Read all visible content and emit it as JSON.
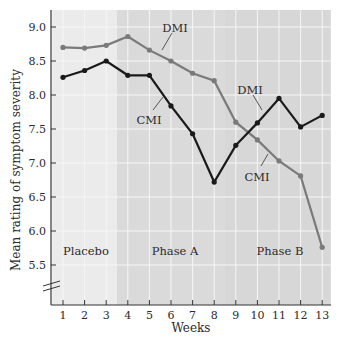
{
  "chart_data": {
    "type": "line",
    "title": "",
    "xlabel": "Weeks",
    "ylabel": "Mean rating of symptom severity",
    "xlim": [
      1,
      13
    ],
    "ylim": [
      5.5,
      9.0
    ],
    "x": [
      1,
      2,
      3,
      4,
      5,
      6,
      7,
      8,
      9,
      10,
      11,
      12,
      13
    ],
    "x_ticks": [
      "1",
      "2",
      "3",
      "4",
      "5",
      "6",
      "7",
      "8",
      "9",
      "10",
      "11",
      "12",
      "13"
    ],
    "y_ticks": [
      "9.0",
      "8.5",
      "8.0",
      "7.5",
      "7.0",
      "6.5",
      "6.0",
      "5.5"
    ],
    "y_tick_values": [
      9.0,
      8.5,
      8.0,
      7.5,
      7.0,
      6.5,
      6.0,
      5.5
    ],
    "grid": true,
    "axis_break": true,
    "series": [
      {
        "name": "Gray line (DMI in Phase A, CMI in Phase B)",
        "color": "#7a7a7a",
        "values": [
          8.7,
          8.69,
          8.73,
          8.86,
          8.66,
          8.5,
          8.32,
          8.21,
          7.6,
          7.34,
          7.03,
          6.81,
          5.76
        ]
      },
      {
        "name": "Black line (CMI in Phase A, DMI in Phase B)",
        "color": "#1a1a1a",
        "values": [
          8.26,
          8.36,
          8.5,
          8.29,
          8.29,
          7.84,
          7.43,
          6.72,
          7.26,
          7.59,
          7.95,
          7.53,
          7.7
        ]
      }
    ],
    "phases": [
      {
        "label": "Placebo",
        "from_week": 0.5,
        "to_week": 3.5,
        "color": "#ebebeb"
      },
      {
        "label": "Phase A",
        "from_week": 3.5,
        "to_week": 8.5,
        "color": "#dadada"
      },
      {
        "label": "Phase B",
        "from_week": 8.5,
        "to_week": 13.4,
        "color": "#d7d7d7"
      }
    ],
    "annotations": [
      {
        "text": "DMI",
        "x": 175,
        "y": 28,
        "line": [
          172,
          33,
          162,
          50
        ],
        "series": 0
      },
      {
        "text": "CMI",
        "x": 149,
        "y": 120,
        "line": [
          153,
          110,
          163,
          97
        ],
        "series": 1
      },
      {
        "text": "DMI",
        "x": 250,
        "y": 90,
        "line": [
          253,
          95,
          262,
          110
        ],
        "series": 1
      },
      {
        "text": "CMI",
        "x": 257,
        "y": 177,
        "line": [
          261,
          166,
          268,
          154
        ],
        "series": 0
      }
    ],
    "legend": "inline labels"
  }
}
